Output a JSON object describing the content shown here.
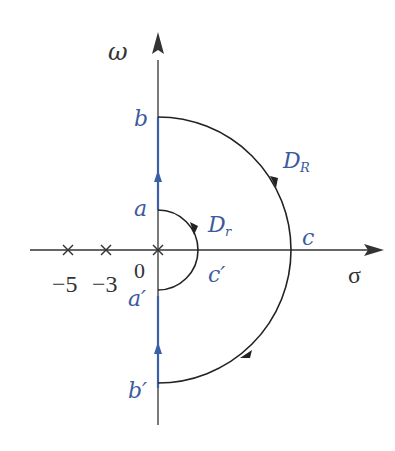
{
  "diagram": {
    "type": "nyquist-contour",
    "axes": {
      "vertical_label": "ω",
      "horizontal_label": "σ",
      "origin_label": "0"
    },
    "poles": [
      {
        "value": -5,
        "label": "−5"
      },
      {
        "value": -3,
        "label": "−3"
      },
      {
        "value": 0,
        "label": ""
      }
    ],
    "points": {
      "b": "b",
      "a": "a",
      "a_prime": "a′",
      "b_prime": "b′",
      "c": "c",
      "c_prime": "c′"
    },
    "contours": {
      "large": {
        "label_main": "D",
        "label_sub": "R"
      },
      "small": {
        "label_main": "D",
        "label_sub": "r"
      }
    },
    "colors": {
      "axis": "#333333",
      "contour": "#222222",
      "blue_segment": "#3a5fa8",
      "label_blue": "#3d5a9e",
      "label_black": "#333333"
    }
  }
}
